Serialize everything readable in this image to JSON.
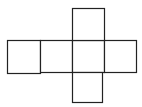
{
  "diagram": {
    "type": "cube-net",
    "stroke_color": "#222222",
    "fill_color": "#ffffff",
    "squares": [
      {
        "id": "row-1",
        "x": 7,
        "y": 40,
        "size": 33
      },
      {
        "id": "row-2",
        "x": 40,
        "y": 40,
        "size": 32
      },
      {
        "id": "row-3-center",
        "x": 72,
        "y": 40,
        "size": 32
      },
      {
        "id": "row-4",
        "x": 104,
        "y": 40,
        "size": 32
      },
      {
        "id": "top",
        "x": 72,
        "y": 8,
        "size": 32
      },
      {
        "id": "bottom",
        "x": 72,
        "y": 72,
        "size": 30
      }
    ]
  }
}
